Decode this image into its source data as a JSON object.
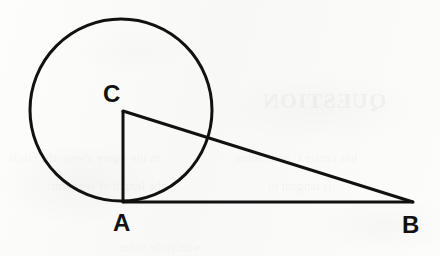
{
  "figure": {
    "background_color": "#fbfbfa",
    "ink_color": "#111111",
    "stroke_width": 3
  },
  "labels": {
    "center": "C",
    "tangent_point": "A",
    "external_point": "B"
  },
  "geometry": {
    "circle": {
      "name": "circle-C",
      "center_x": 121,
      "center_y": 110,
      "radius": 91
    },
    "points": {
      "A": {
        "x": 123,
        "y": 202
      },
      "B": {
        "x": 413,
        "y": 202
      },
      "C": {
        "x": 123,
        "y": 111
      }
    },
    "segments": [
      {
        "name": "radius-CA",
        "from": "C",
        "to": "A"
      },
      {
        "name": "tangent-AB",
        "from": "A",
        "to": "B"
      },
      {
        "name": "hypotenuse-CB",
        "from": "C",
        "to": "B"
      }
    ]
  },
  "label_positions": {
    "C": {
      "x": 103,
      "y": 82,
      "font_size": 24
    },
    "A": {
      "x": 113,
      "y": 211,
      "font_size": 24
    },
    "B": {
      "x": 402,
      "y": 213,
      "font_size": 24
    }
  },
  "background_artifacts": [
    {
      "name": "bleed-heading",
      "text": "QUESTION",
      "x": 262,
      "y": 88,
      "font_size": 22
    },
    {
      "name": "bleed-line-1",
      "text": "in the figure above, the circle",
      "x": 8,
      "y": 150,
      "font_size": 13
    },
    {
      "name": "bleed-line-2",
      "text": "has center C and radius",
      "x": 236,
      "y": 150,
      "font_size": 13
    },
    {
      "name": "bleed-line-3",
      "text": "the length of segment",
      "x": 52,
      "y": 178,
      "font_size": 13
    },
    {
      "name": "bleed-line-4",
      "text": "is tangent to",
      "x": 268,
      "y": 178,
      "font_size": 13
    },
    {
      "name": "bleed-line-5",
      "text": "what is the value",
      "x": 120,
      "y": 240,
      "font_size": 12
    }
  ]
}
